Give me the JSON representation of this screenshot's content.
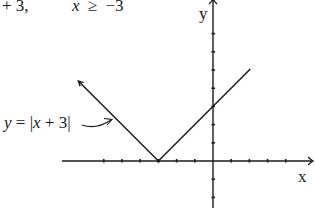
{
  "header_fragment": {
    "left": "+ 3,",
    "condition_var": "x",
    "condition_op": "≥",
    "condition_val": "−3"
  },
  "chart_data": {
    "type": "line",
    "title": "",
    "function": "y = |x + 3|",
    "annotation": {
      "text_prefix": "y",
      "text_eq": " = |",
      "text_var": "x",
      "text_suffix": " + 3|",
      "arrow": "curved arrow pointing to left branch"
    },
    "xlabel": "x",
    "ylabel": "y",
    "xlim": [
      -8.3,
      5.5
    ],
    "ylim": [
      -2.6,
      8.9
    ],
    "x_ticks": [
      -6,
      -5,
      -4,
      -3,
      -2,
      -1,
      1,
      2,
      3,
      4
    ],
    "y_ticks": [
      -2,
      -1,
      1,
      2,
      3,
      4,
      5,
      6,
      7
    ],
    "tick_labels_shown": false,
    "grid": false,
    "series": [
      {
        "name": "y = |x + 3|",
        "points": [
          [
            -7.4,
            4.4
          ],
          [
            -3,
            0
          ],
          [
            2.05,
            5.05
          ]
        ],
        "left_arrowhead": true,
        "right_arrowhead": false
      }
    ],
    "key_points": {
      "vertex": [
        -3,
        0
      ],
      "y_intercept": [
        0,
        3
      ]
    },
    "colors": {
      "ink": "#1a1a1a",
      "background": "#ffffff"
    }
  }
}
